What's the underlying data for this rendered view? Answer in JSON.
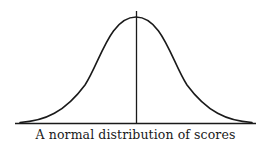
{
  "diagram": {
    "caption": "A normal distribution of scores",
    "stroke_color": "#1a1a1a",
    "background": "#ffffff",
    "elements": [
      {
        "type": "curve",
        "shape": "bell / gaussian",
        "description": "symmetric bell-shaped curve"
      },
      {
        "type": "line",
        "orientation": "horizontal",
        "description": "baseline axis"
      },
      {
        "type": "line",
        "orientation": "vertical",
        "description": "center line at the mean, through the peak"
      }
    ]
  }
}
